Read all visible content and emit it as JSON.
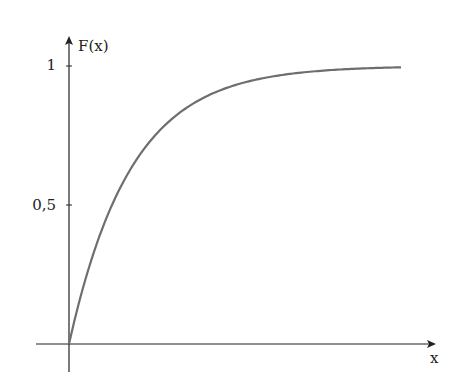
{
  "chart_data": {
    "type": "line",
    "title": "",
    "xlabel": "x",
    "ylabel": "F(x)",
    "yticks": [
      {
        "value": 0.5,
        "label": "0,5"
      },
      {
        "value": 1,
        "label": "1"
      }
    ],
    "xticks": [],
    "ylim": [
      0,
      1.1
    ],
    "xlim": [
      0,
      5.8
    ],
    "grid": false,
    "legend": null,
    "series": [
      {
        "name": "F(x) = 1 - e^{-x}",
        "x": [
          0,
          0.25,
          0.5,
          0.75,
          1,
          1.25,
          1.5,
          1.75,
          2,
          2.5,
          3,
          3.5,
          4,
          4.5,
          5,
          5.35
        ],
        "values": [
          0,
          0.221,
          0.393,
          0.528,
          0.632,
          0.713,
          0.777,
          0.826,
          0.865,
          0.918,
          0.95,
          0.97,
          0.982,
          0.989,
          0.993,
          0.995
        ]
      }
    ]
  },
  "labels": {
    "ylabel": "F(x)",
    "xlabel": "x",
    "ytick_1": "1",
    "ytick_half": "0,5"
  },
  "colors": {
    "axis": "#222222",
    "curve": "#6e6e6e"
  }
}
